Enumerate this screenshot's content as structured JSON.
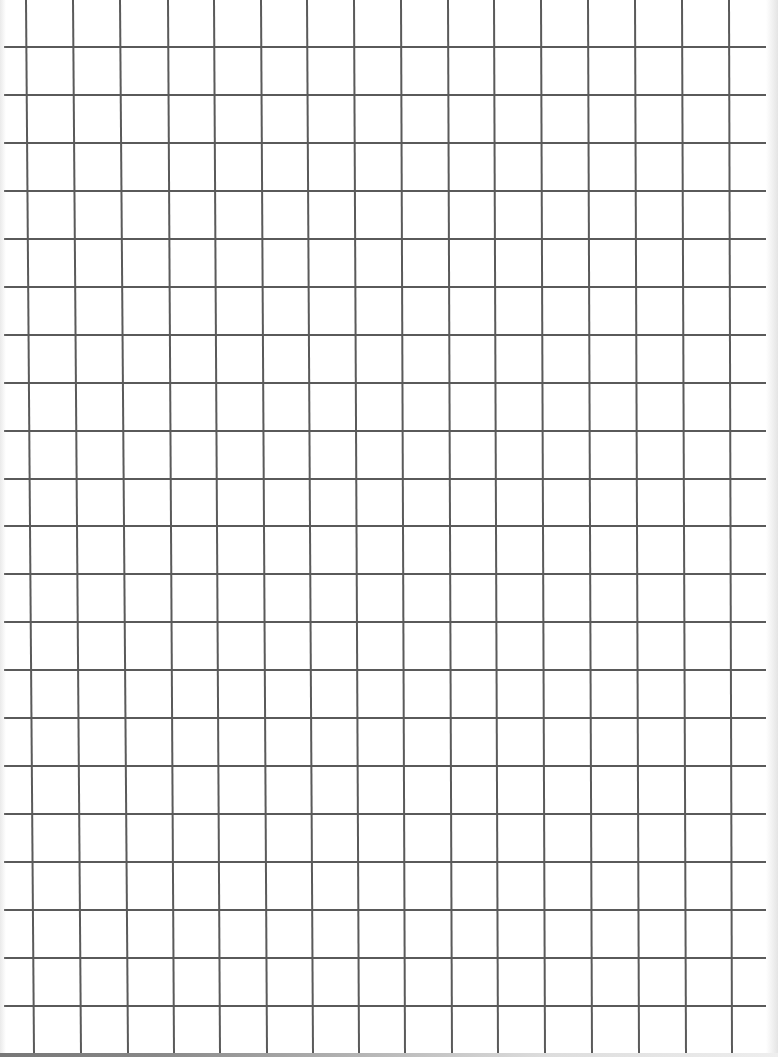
{
  "page": {
    "type": "graph-paper",
    "background_color": "#ffffff",
    "line_color": "#5a5a5a",
    "line_width_px": 2
  },
  "grid": {
    "columns_spacing_px": 47,
    "rows_spacing_px": 48,
    "vertical_lines_top_x": [
      25,
      72,
      119,
      167,
      213,
      260,
      306,
      353,
      400,
      447,
      493,
      540,
      587,
      634,
      681,
      728
    ],
    "vertical_lines_bottom_x": [
      33,
      80,
      127,
      173,
      219,
      266,
      312,
      358,
      404,
      451,
      497,
      544,
      591,
      638,
      685,
      731
    ],
    "horizontal_lines_y": [
      46,
      94,
      142,
      190,
      238,
      286,
      334,
      382,
      430,
      478,
      525,
      573,
      621,
      669,
      717,
      765,
      813,
      861,
      909,
      957,
      1005
    ]
  }
}
